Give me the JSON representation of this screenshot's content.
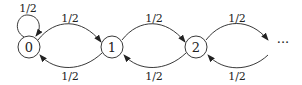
{
  "diagram": {
    "type": "markov-chain",
    "nodes": [
      {
        "id": "0",
        "label": "0"
      },
      {
        "id": "1",
        "label": "1"
      },
      {
        "id": "2",
        "label": "2"
      },
      {
        "id": "more",
        "label": "···"
      }
    ],
    "edges": {
      "self_0": "1/2",
      "e01": "1/2",
      "e10": "1/2",
      "e12": "1/2",
      "e21": "1/2",
      "e2m": "1/2",
      "em2": "1/2"
    },
    "colors": {
      "stroke": "#222222",
      "background": "#ffffff"
    }
  }
}
